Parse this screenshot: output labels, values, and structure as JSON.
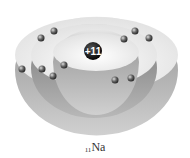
{
  "diagram": {
    "nucleus": {
      "label": "+11",
      "x": 93,
      "y": 51
    },
    "element_label": {
      "atomic_number": "11",
      "symbol": "Na"
    },
    "shells": [
      {
        "name": "shell-1",
        "electrons": 2
      },
      {
        "name": "shell-2",
        "electrons": 8
      },
      {
        "name": "shell-3",
        "electrons": 1
      }
    ],
    "electrons": [
      {
        "x": 54,
        "y": 31
      },
      {
        "x": 41,
        "y": 38
      },
      {
        "x": 135,
        "y": 31
      },
      {
        "x": 149,
        "y": 38
      },
      {
        "x": 124,
        "y": 39
      },
      {
        "x": 22,
        "y": 69
      },
      {
        "x": 42,
        "y": 69
      },
      {
        "x": 64,
        "y": 65
      },
      {
        "x": 53,
        "y": 76
      },
      {
        "x": 115,
        "y": 80
      },
      {
        "x": 131,
        "y": 78
      }
    ],
    "colors": {
      "shell_light": "#f4f4f4",
      "shell_dark": "#8c8c8c",
      "nucleus": "#111111",
      "electron": "#555555"
    }
  }
}
